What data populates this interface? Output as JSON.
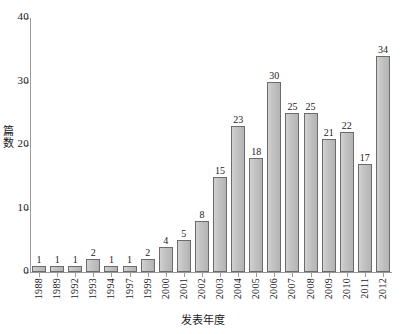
{
  "chart_data": {
    "type": "bar",
    "title": "",
    "subtitle": "",
    "xlabel": "发表年度",
    "ylabel": "篇数",
    "categories": [
      "1988",
      "1989",
      "1992",
      "1993",
      "1994",
      "1997",
      "1999",
      "2000",
      "2001",
      "2002",
      "2003",
      "2004",
      "2005",
      "2006",
      "2007",
      "2008",
      "2009",
      "2010",
      "2011",
      "2012"
    ],
    "values": [
      1,
      1,
      1,
      2,
      1,
      1,
      2,
      4,
      5,
      8,
      15,
      23,
      18,
      30,
      25,
      25,
      21,
      22,
      17,
      34
    ],
    "ylim": [
      0,
      40
    ],
    "yticks": [
      "0",
      "10",
      "20",
      "30",
      "40"
    ],
    "ytick_values": [
      0,
      10,
      20,
      30,
      40
    ],
    "grid": false,
    "legend": false,
    "legend_position": "none",
    "bar_fill_color": "#c4c4c4",
    "bar_edge_color": "#6b6b6b",
    "axis_color": "#9a9a9a",
    "text_color": "#1a1a1a",
    "show_value_labels": true
  }
}
